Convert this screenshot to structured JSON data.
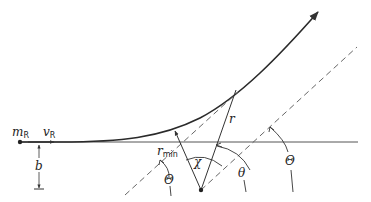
{
  "diagram": {
    "labels": {
      "mass": "m",
      "mass_sub": "R",
      "velocity": "v",
      "velocity_sub": "R",
      "impact_parameter": "b",
      "rmin": "r",
      "rmin_sub": "min",
      "r": "r",
      "chi": "χ",
      "theta": "θ",
      "Theta_left": "Θ",
      "Theta_right": "Θ"
    },
    "colors": {
      "stroke": "#333333",
      "curve": "#2a2a2a"
    }
  }
}
